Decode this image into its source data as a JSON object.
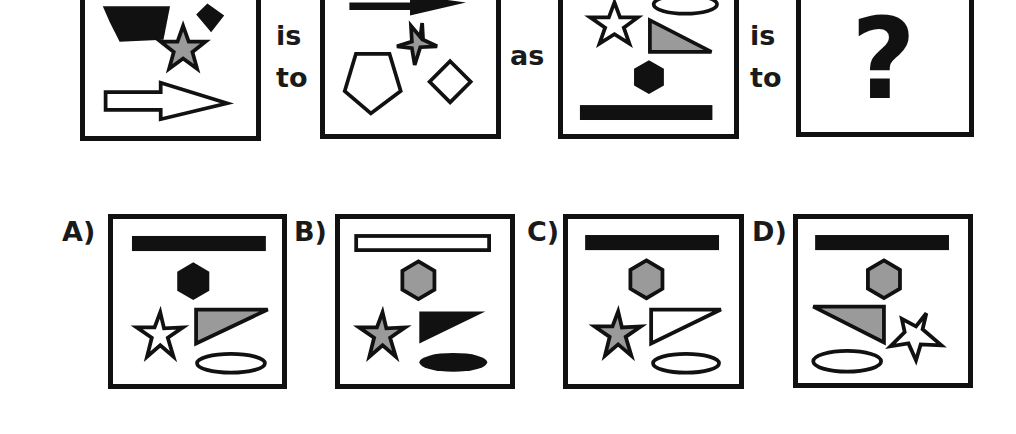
{
  "puzzle": {
    "connectors": {
      "is_1": "is",
      "to_1": "to",
      "as": "as",
      "is_2": "is",
      "to_2": "to"
    },
    "question_mark": "?",
    "colors": {
      "black": "#111111",
      "gray": "#9a9a9a",
      "white": "#ffffff"
    },
    "top_row": [
      {
        "id": "box-1",
        "shapes": [
          "black pentagon",
          "black diamond",
          "gray star",
          "white arrow"
        ]
      },
      {
        "id": "box-2",
        "shapes": [
          "black arrow",
          "gray star",
          "white pentagon",
          "white diamond"
        ]
      },
      {
        "id": "box-3",
        "shapes": [
          "white ellipse",
          "white star",
          "gray triangle",
          "black hexagon",
          "black bar"
        ]
      },
      {
        "id": "box-4",
        "shapes": [
          "question mark"
        ]
      }
    ],
    "options": [
      {
        "label": "A)",
        "shapes": [
          "black bar",
          "black hexagon",
          "white star",
          "gray triangle",
          "white ellipse"
        ]
      },
      {
        "label": "B)",
        "shapes": [
          "white bar",
          "gray hexagon",
          "gray star",
          "black triangle",
          "black ellipse"
        ]
      },
      {
        "label": "C)",
        "shapes": [
          "black bar",
          "gray hexagon",
          "gray star",
          "white triangle",
          "white ellipse"
        ]
      },
      {
        "label": "D)",
        "shapes": [
          "black bar",
          "gray hexagon",
          "gray triangle (mirrored)",
          "white star",
          "white ellipse"
        ]
      }
    ]
  }
}
